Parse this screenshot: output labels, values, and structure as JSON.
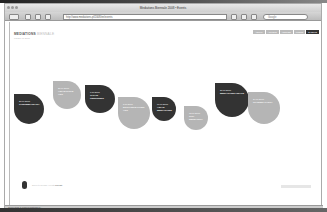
{
  "browser": {
    "title": "Mediations Biennale 2008 • Events",
    "url": "http://www.mediations.pl/2008/en/events",
    "search_placeholder": "Google",
    "status": "Connecting to www.mediations.pl..."
  },
  "header": {
    "logo_main": "MEDIATIONS",
    "logo_accent": "BIENNALE",
    "subtitle": "POZNAN 2008",
    "nav": [
      {
        "label": "ABOUT",
        "active": false
      },
      {
        "label": "ARTISTS",
        "active": false
      },
      {
        "label": "VENUES",
        "active": false
      },
      {
        "label": "PRESS",
        "active": false
      },
      {
        "label": "EVENTS",
        "active": true
      }
    ]
  },
  "events": [
    {
      "date": "20.09.2008",
      "title": "CONTEMPORARY",
      "tone": "dark"
    },
    {
      "date": "21.09.2008",
      "title": "ASIAN CHILD ART",
      "tone": "light"
    },
    {
      "date": "1.10.2008",
      "title": "JAPAN CENTURIES",
      "tone": "dark"
    },
    {
      "date": "5.10.2008",
      "title": "EXCHANGE POINT ART",
      "tone": "light"
    },
    {
      "date": "10.10.2008",
      "title": "ASIAN MEDIATIONS",
      "tone": "dark"
    },
    {
      "date": "12.10.2008",
      "title": "CITY RESEARCH",
      "tone": "light"
    },
    {
      "date": "20.10.2008",
      "title": "MEDIATIONS FINALE",
      "tone": "dark"
    },
    {
      "date": "24.10.2008",
      "title": "CLOSING PARTY",
      "tone": "light"
    }
  ],
  "footer": {
    "text": "Scroll to browse events",
    "link": "Full list"
  }
}
